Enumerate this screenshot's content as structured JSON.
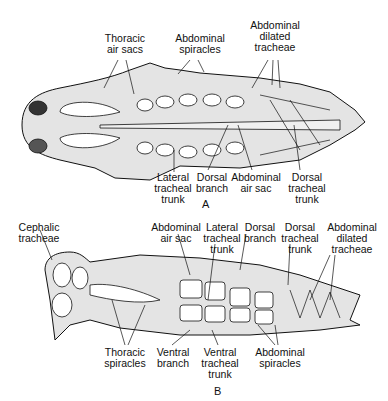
{
  "figure": {
    "panels": [
      {
        "id": "A",
        "letter": "A",
        "view": "dorsal",
        "labels": [
          {
            "text": "Thoracic\nair sacs"
          },
          {
            "text": "Abdominal\nspiracles"
          },
          {
            "text": "Abdominal\ndilated\ntracheae"
          },
          {
            "text": "Lateral\ntracheal\ntrunk"
          },
          {
            "text": "Dorsal\nbranch"
          },
          {
            "text": "Abdominal\nair sac"
          },
          {
            "text": "Dorsal\ntracheal\ntrunk"
          }
        ]
      },
      {
        "id": "B",
        "letter": "B",
        "view": "lateral",
        "labels": [
          {
            "text": "Cephalic\ntracheae"
          },
          {
            "text": "Abdominal\nair sac"
          },
          {
            "text": "Lateral\ntracheal\ntrunk"
          },
          {
            "text": "Dorsal\nbranch"
          },
          {
            "text": "Dorsal\ntracheal\ntrunk"
          },
          {
            "text": "Abdominal\ndilated\ntracheae"
          },
          {
            "text": "Thoracic\nspiracles"
          },
          {
            "text": "Ventral\nbranch"
          },
          {
            "text": "Ventral\ntracheal\ntrunk"
          },
          {
            "text": "Abdominal\nspiracles"
          }
        ]
      }
    ],
    "colors": {
      "ink": "#111111",
      "stipple": "#d9d9d9",
      "background": "#ffffff"
    }
  }
}
